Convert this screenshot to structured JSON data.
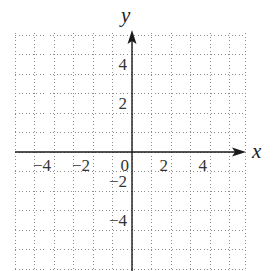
{
  "chart_data": {
    "type": "scatter",
    "title": "",
    "xlabel": "x",
    "ylabel": "y",
    "xlim": [
      -6,
      6
    ],
    "ylim": [
      -6,
      6
    ],
    "grid": true,
    "grid_style": "dotted",
    "grid_step": 1,
    "x_ticks": [
      {
        "value": -4,
        "label": "−4"
      },
      {
        "value": -2,
        "label": "−2"
      },
      {
        "value": 0,
        "label": "0"
      },
      {
        "value": 2,
        "label": "2"
      },
      {
        "value": 4,
        "label": "4"
      }
    ],
    "y_ticks": [
      {
        "value": 4,
        "label": "4"
      },
      {
        "value": 2,
        "label": "2"
      },
      {
        "value": -2,
        "label": "−2"
      },
      {
        "value": -4,
        "label": "−4"
      }
    ],
    "series": [],
    "legend": null
  },
  "colors": {
    "grid": "#8c8c8c",
    "axis": "#1a1a1a",
    "text": "#333333"
  }
}
